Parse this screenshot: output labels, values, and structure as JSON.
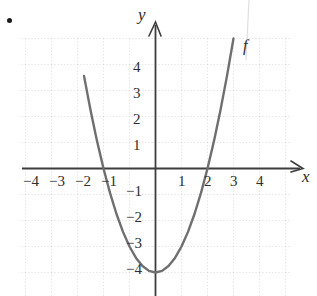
{
  "figure": {
    "bullet_marker": "•",
    "axis_labels": {
      "x": "x",
      "y": "y"
    },
    "curve_label": "f"
  },
  "chart_data": {
    "type": "line",
    "title": "",
    "subtitle": "",
    "xlabel": "x",
    "ylabel": "y",
    "function": "y = x^2 - 4",
    "curve_name": "f",
    "grid": true,
    "grid_style": "dotted",
    "legend": "none",
    "xlim": [
      -5,
      5
    ],
    "ylim": [
      -5,
      5
    ],
    "xticks": [
      -4,
      -3,
      -2,
      -1,
      1,
      2,
      3,
      4
    ],
    "yticks": [
      4,
      3,
      2,
      1,
      -1,
      -2,
      -3,
      -4
    ],
    "xtick_labels": [
      "−4",
      "−3",
      "−2",
      "−1",
      "1",
      "2",
      "3",
      "4"
    ],
    "ytick_labels": [
      "4",
      "3",
      "2",
      "1",
      "−1",
      "−2",
      "−3",
      "−4"
    ],
    "vertex": [
      0,
      -4
    ],
    "roots": [
      -2,
      2
    ],
    "y_intercept": -4,
    "x": [
      -2.75,
      -2.5,
      -2.25,
      -2,
      -1.75,
      -1.5,
      -1.25,
      -1,
      -0.75,
      -0.5,
      -0.25,
      0,
      0.25,
      0.5,
      0.75,
      1,
      1.25,
      1.5,
      1.75,
      2,
      2.25,
      2.5,
      2.75,
      3
    ],
    "values": [
      3.5625,
      2.25,
      1.0625,
      0,
      -0.9375,
      -1.75,
      -2.4375,
      -3,
      -3.4375,
      -3.75,
      -3.9375,
      -4,
      -3.9375,
      -3.75,
      -3.4375,
      -3,
      -2.4375,
      -1.75,
      -0.9375,
      0,
      1.0625,
      2.25,
      3.5625,
      5
    ],
    "colors": {
      "curve": "#6f6f6f",
      "axis": "#3a3a3a",
      "grid": "#c9c9c9",
      "text": "#2e2e2e"
    }
  },
  "xtick_positions": [
    {
      "label": "−4",
      "left": 23,
      "top": 174
    },
    {
      "label": "−3",
      "left": 49,
      "top": 174
    },
    {
      "label": "−2",
      "left": 75,
      "top": 174
    },
    {
      "label": "−1",
      "left": 101,
      "top": 174
    },
    {
      "label": "1",
      "left": 178,
      "top": 174
    },
    {
      "label": "2",
      "left": 204,
      "top": 174
    },
    {
      "label": "3",
      "left": 230,
      "top": 174
    },
    {
      "label": "4",
      "left": 256,
      "top": 174
    }
  ],
  "ytick_positions": [
    {
      "label": "4",
      "left": 133,
      "top": 60
    },
    {
      "label": "3",
      "left": 133,
      "top": 86
    },
    {
      "label": "2",
      "left": 133,
      "top": 112
    },
    {
      "label": "1",
      "left": 133,
      "top": 138
    },
    {
      "label": "−1",
      "left": 126,
      "top": 184
    },
    {
      "label": "−2",
      "left": 126,
      "top": 210
    },
    {
      "label": "−3",
      "left": 126,
      "top": 236
    },
    {
      "label": "−4",
      "left": 126,
      "top": 262
    }
  ]
}
